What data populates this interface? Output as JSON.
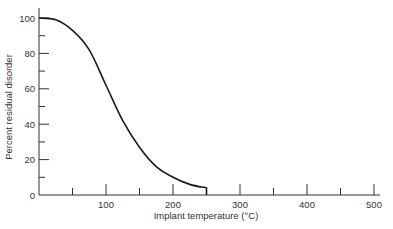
{
  "chart_data": {
    "type": "line",
    "title": "",
    "xlabel": "Implant temperature (°C)",
    "ylabel": "Percent residual disorder",
    "xlim": [
      0,
      500
    ],
    "ylim": [
      0,
      100
    ],
    "x_ticks": [
      100,
      200,
      300,
      400,
      500
    ],
    "x_minor_ticks": [
      50,
      150,
      250,
      350,
      450
    ],
    "y_ticks": [
      0,
      20,
      40,
      60,
      80,
      100
    ],
    "y_minor_ticks": [
      10,
      30,
      50,
      70,
      90
    ],
    "grid": false,
    "legend": null,
    "series": [
      {
        "name": "Residual disorder",
        "x": [
          0,
          25,
          50,
          75,
          100,
          125,
          150,
          175,
          200,
          225,
          250
        ],
        "y": [
          100,
          99,
          93,
          82,
          62,
          42,
          27,
          16,
          10,
          6,
          4
        ]
      }
    ],
    "annotations": [
      "Curve terminates at ~250 °C with a short vertical drop to the axis"
    ]
  },
  "labels": {
    "xlabel": "Implant temperature (°C)",
    "ylabel": "Percent residual disorder",
    "x_tick_labels": [
      "100",
      "200",
      "300",
      "400",
      "500"
    ],
    "y_tick_labels": [
      "0",
      "20",
      "40",
      "60",
      "80",
      "100"
    ]
  },
  "colors": {
    "axis": "#333333",
    "curve": "#1a1a1a"
  }
}
